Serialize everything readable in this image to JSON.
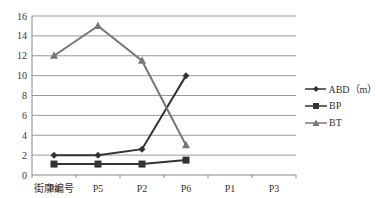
{
  "chart_data": {
    "type": "line",
    "title": "",
    "xlabel": "街廓编号",
    "ylabel": "",
    "categories": [
      "P4",
      "P5",
      "P2",
      "P6",
      "P1",
      "P3"
    ],
    "ylim": [
      0,
      16
    ],
    "yticks": [
      0,
      2,
      4,
      6,
      8,
      10,
      12,
      14,
      16
    ],
    "grid": true,
    "legend_position": "right",
    "series": [
      {
        "name": "ABD（m）",
        "marker": "diamond",
        "color": "#333333",
        "values": [
          2,
          2,
          2.6,
          10,
          null,
          null
        ]
      },
      {
        "name": "BP",
        "marker": "square",
        "color": "#333333",
        "values": [
          1.1,
          1.1,
          1.1,
          1.5,
          null,
          null
        ]
      },
      {
        "name": "BT",
        "marker": "triangle",
        "color": "#777777",
        "values": [
          12,
          15,
          11.5,
          3,
          null,
          null
        ]
      }
    ]
  }
}
